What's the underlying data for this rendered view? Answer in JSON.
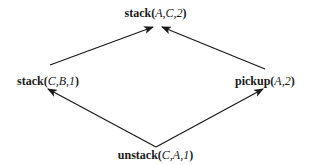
{
  "diagram": {
    "type": "plan-ordering-graph",
    "nodes": [
      {
        "id": "top",
        "fn": "stack",
        "args": "A,C,2"
      },
      {
        "id": "left",
        "fn": "stack",
        "args": "C,B,1"
      },
      {
        "id": "right",
        "fn": "pickup",
        "args": "A,2"
      },
      {
        "id": "bottom",
        "fn": "unstack",
        "args": "C,A,1"
      }
    ],
    "edges": [
      {
        "from": "left",
        "to": "top"
      },
      {
        "from": "right",
        "to": "top"
      },
      {
        "from": "bottom",
        "to": "left"
      },
      {
        "from": "bottom",
        "to": "right"
      }
    ],
    "colors": {
      "line": "#1a1a1a",
      "text": "#1a1a1a",
      "background": "#ffffff"
    }
  }
}
